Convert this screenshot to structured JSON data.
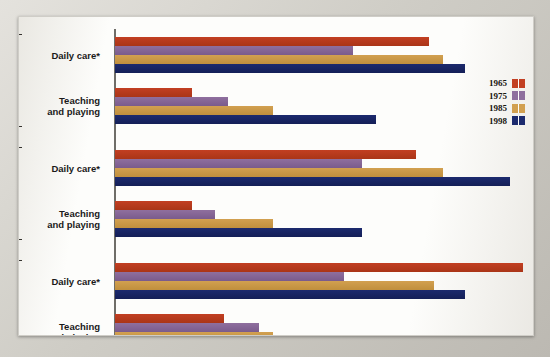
{
  "chart_data": {
    "type": "bar",
    "orientation": "horizontal",
    "title": "",
    "xlabel": "Average number of minutes per day",
    "ylabel": "",
    "xlim": [
      27,
      115
    ],
    "axis_break": true,
    "axis_break_symbol": "//",
    "grid": false,
    "legend_position": "right",
    "xticks": [
      30,
      35,
      40,
      45,
      50,
      55,
      60,
      65,
      70,
      75,
      80,
      85,
      90,
      95,
      100,
      105,
      110,
      115
    ],
    "legend": [
      "1965",
      "1975",
      "1985",
      "1998"
    ],
    "series_colors": {
      "1965": "#c23f22",
      "1975": "#8f6f9e",
      "1985": "#d2a050",
      "1998": "#1c2a6e"
    },
    "groups": [
      {
        "group": "All mothers",
        "group_line1": "All",
        "group_line2": "mothers",
        "categories": [
          {
            "label": "Daily care*",
            "label_line1": "Daily care*",
            "label_line2": "",
            "values": {
              "1965": 90,
              "1975": 73,
              "1985": 93,
              "1998": 98
            }
          },
          {
            "label": "Teaching and playing",
            "label_line1": "Teaching",
            "label_line2": "and playing",
            "values": {
              "1965": 37,
              "1975": 45,
              "1985": 55,
              "1998": 78
            }
          }
        ]
      },
      {
        "group": "Married mothers",
        "group_line1": "Married",
        "group_line2": "mothers",
        "categories": [
          {
            "label": "Daily care*",
            "label_line1": "Daily care*",
            "label_line2": "",
            "values": {
              "1965": 87,
              "1975": 75,
              "1985": 93,
              "1998": 108
            }
          },
          {
            "label": "Teaching and playing",
            "label_line1": "Teaching",
            "label_line2": "and playing",
            "values": {
              "1965": 37,
              "1975": 42,
              "1985": 55,
              "1998": 75
            }
          }
        ]
      },
      {
        "group": "Single mothers",
        "group_line1": "Single",
        "group_line2": "mothers",
        "categories": [
          {
            "label": "Daily care*",
            "label_line1": "Daily care*",
            "label_line2": "",
            "values": {
              "1965": 111,
              "1975": 71,
              "1985": 91,
              "1998": 98
            }
          },
          {
            "label": "Teaching and playing",
            "label_line1": "Teaching",
            "label_line2": "and playing",
            "values": {
              "1965": 44,
              "1975": 52,
              "1985": 55,
              "1998": 88
            }
          }
        ]
      }
    ]
  }
}
